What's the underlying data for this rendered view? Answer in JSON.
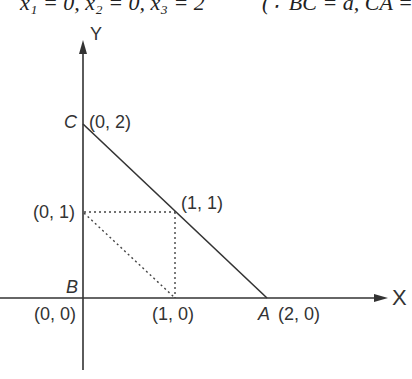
{
  "header": {
    "equation_left": "x₁ = 0, x₂ = 0, x₃ = 2",
    "equation_right": "(∵ BC = a, CA ="
  },
  "diagram": {
    "axes": {
      "x_label": "X",
      "y_label": "Y"
    },
    "points": [
      {
        "name": "C",
        "coord": "(0, 2)"
      },
      {
        "name": "",
        "coord": "(1, 1)"
      },
      {
        "name": "",
        "coord": "(0, 1)"
      },
      {
        "name": "B",
        "coord": "(0, 0)"
      },
      {
        "name": "",
        "coord": "(1, 0)"
      },
      {
        "name": "A",
        "coord": "(2, 0)"
      }
    ],
    "segments": [
      {
        "from": "C(0,2)",
        "to": "A(2,0)",
        "style": "solid"
      },
      {
        "from": "(0,1)",
        "to": "(1,1)",
        "style": "dotted"
      },
      {
        "from": "(1,1)",
        "to": "(1,0)",
        "style": "dotted"
      },
      {
        "from": "(0,1)",
        "to": "(1,0)",
        "style": "dotted"
      }
    ]
  }
}
